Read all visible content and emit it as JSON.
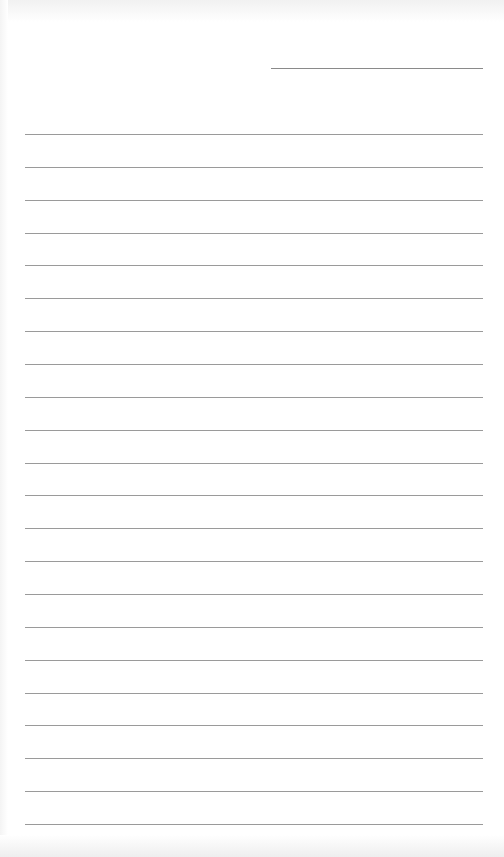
{
  "page": {
    "type": "lined-paper",
    "header_line": {
      "label": "",
      "x": 271,
      "y": 68,
      "width": 212
    },
    "rules": {
      "count": 22,
      "first_y": 134,
      "spacing": 32.86,
      "x": 25,
      "width": 458
    },
    "colors": {
      "background": "#ffffff",
      "rule": "#9a9a9a",
      "header_rule": "#8a8a8a"
    }
  }
}
